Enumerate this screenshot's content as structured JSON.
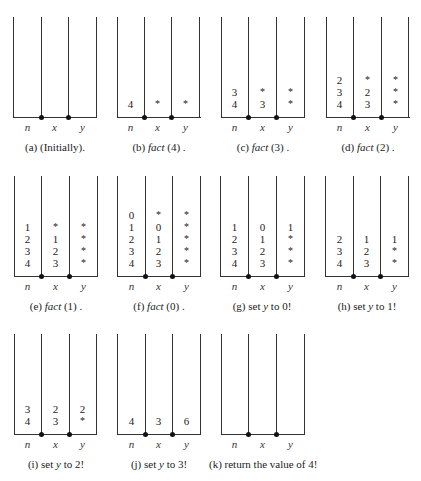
{
  "figure": {
    "variables": [
      "n",
      "x",
      "y"
    ],
    "panels": [
      {
        "id": "a",
        "caption_prefix": "(a)",
        "caption_fn": "",
        "caption_text": "(Initially).",
        "stack": {
          "n": [],
          "x": [],
          "y": []
        }
      },
      {
        "id": "b",
        "caption_prefix": "(b)",
        "caption_fn": "fact",
        "caption_text": "(4) .",
        "stack": {
          "n": [
            "4"
          ],
          "x": [
            "*"
          ],
          "y": [
            "*"
          ]
        }
      },
      {
        "id": "c",
        "caption_prefix": "(c)",
        "caption_fn": "fact",
        "caption_text": "(3) .",
        "stack": {
          "n": [
            "3",
            "4"
          ],
          "x": [
            "*",
            "3"
          ],
          "y": [
            "*",
            "*"
          ]
        }
      },
      {
        "id": "d",
        "caption_prefix": "(d)",
        "caption_fn": "fact",
        "caption_text": "(2) .",
        "stack": {
          "n": [
            "2",
            "3",
            "4"
          ],
          "x": [
            "*",
            "2",
            "3"
          ],
          "y": [
            "*",
            "*",
            "*"
          ]
        }
      },
      {
        "id": "e",
        "caption_prefix": "(e)",
        "caption_fn": "fact",
        "caption_text": "(1) .",
        "stack": {
          "n": [
            "1",
            "2",
            "3",
            "4"
          ],
          "x": [
            "*",
            "1",
            "2",
            "3"
          ],
          "y": [
            "*",
            "*",
            "*",
            "*"
          ]
        }
      },
      {
        "id": "f",
        "caption_prefix": "(f)",
        "caption_fn": "fact",
        "caption_text": "(0) .",
        "stack": {
          "n": [
            "0",
            "1",
            "2",
            "3",
            "4"
          ],
          "x": [
            "*",
            "0",
            "1",
            "2",
            "3"
          ],
          "y": [
            "*",
            "*",
            "*",
            "*",
            "*"
          ]
        }
      },
      {
        "id": "g",
        "caption_prefix": "(g)",
        "caption_set": "set",
        "caption_var": "y",
        "caption_text": "to 0!",
        "stack": {
          "n": [
            "1",
            "2",
            "3",
            "4"
          ],
          "x": [
            "0",
            "1",
            "2",
            "3"
          ],
          "y": [
            "1",
            "*",
            "*",
            "*"
          ]
        }
      },
      {
        "id": "h",
        "caption_prefix": "(h)",
        "caption_set": "set",
        "caption_var": "y",
        "caption_text": "to 1!",
        "stack": {
          "n": [
            "2",
            "3",
            "4"
          ],
          "x": [
            "1",
            "2",
            "3"
          ],
          "y": [
            "1",
            "*",
            "*"
          ]
        }
      },
      {
        "id": "i",
        "caption_prefix": "(i)",
        "caption_set": "set",
        "caption_var": "y",
        "caption_text": "to 2!",
        "stack": {
          "n": [
            "3",
            "4"
          ],
          "x": [
            "2",
            "3"
          ],
          "y": [
            "2",
            "*"
          ]
        }
      },
      {
        "id": "j",
        "caption_prefix": "(j)",
        "caption_set": "set",
        "caption_var": "y",
        "caption_text": "to 3!",
        "stack": {
          "n": [
            "4"
          ],
          "x": [
            "3"
          ],
          "y": [
            "6"
          ]
        }
      },
      {
        "id": "k",
        "caption_prefix": "(k)",
        "caption_fn": "",
        "caption_text": "return the value of 4!",
        "stack": {
          "n": [],
          "x": [],
          "y": []
        }
      }
    ]
  }
}
